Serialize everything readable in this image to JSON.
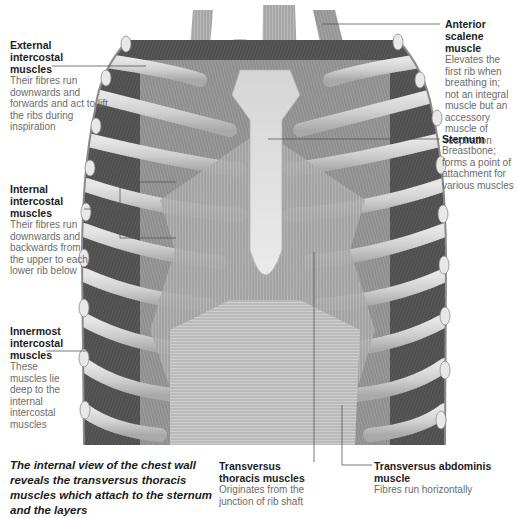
{
  "diagram": {
    "subject": "Internal view of the chest wall",
    "palette": {
      "heading": "#1c1c1c",
      "body_text": "#6b6b6b",
      "leader_line": "#555555",
      "illustration": "greyscale"
    }
  },
  "labels": {
    "external_intercostal": {
      "title": "External intercostal muscles",
      "title_lines": [
        "External",
        "intercostal",
        "muscles"
      ],
      "desc": "Their fibres run downwards and forwards and act to lift the ribs during inspiration"
    },
    "anterior_scalene": {
      "title": "Anterior scalene muscle",
      "desc": "Elevates the first rib when breathing in; not an integral muscle but an accessory muscle of respiration"
    },
    "sternum": {
      "title": "Sternum",
      "desc": "Breastbone; forms a point of attachment for various muscles"
    },
    "internal_intercostal": {
      "title": "Internal intercostal muscles",
      "title_lines": [
        "Internal",
        "intercostal",
        "muscles"
      ],
      "desc": "Their fibres run downwards and backwards from the upper to each lower rib below"
    },
    "innermost_intercostal": {
      "title": "Innermost intercostal muscles",
      "title_lines": [
        "Innermost",
        "intercostal",
        "muscles"
      ],
      "desc": "These muscles lie deep to the internal intercostal muscles"
    },
    "transversus_thoracis": {
      "title": "Transversus thoracis muscles",
      "desc": "Originates from the junction of rib shaft"
    },
    "transversus_abdominis": {
      "title": "Transversus abdominis muscle",
      "desc": "Fibres run horizontally"
    }
  },
  "caption": "The internal view of the chest wall reveals the transversus thoracis muscles which attach to the sternum and the layers"
}
